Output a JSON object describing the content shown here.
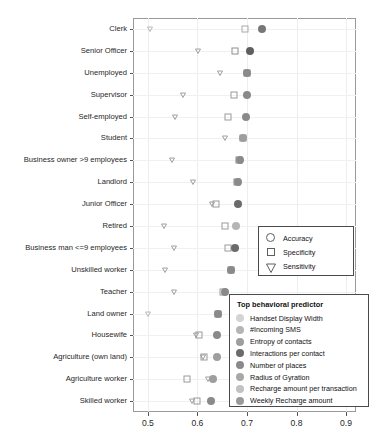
{
  "chart_data": {
    "type": "scatter",
    "title": "",
    "xlabel": "",
    "ylabel": "",
    "xlim": [
      0.47,
      0.92
    ],
    "xticks": [
      "0.5",
      "0.6",
      "0.7",
      "0.8",
      "0.9"
    ],
    "xtick_values": [
      0.5,
      0.6,
      0.7,
      0.8,
      0.9
    ],
    "grid": true,
    "legend_position": "right-inside",
    "categories": [
      "Clerk",
      "Senior Officer",
      "Unemployed",
      "Supervisor",
      "Self-employed",
      "Student",
      "Business owner >9 employees",
      "Landlord",
      "Junior Officer",
      "Retired",
      "Business man <=9 employees",
      "Unskilled worker",
      "Teacher",
      "Land owner",
      "Housewife",
      "Agriculture (own land)",
      "Agriculture worker",
      "Skilled worker"
    ],
    "series": [
      {
        "name": "Accuracy",
        "marker": "circle",
        "values": [
          0.73,
          0.707,
          0.7,
          0.7,
          0.699,
          0.692,
          0.686,
          0.682,
          0.681,
          0.678,
          0.676,
          0.667,
          0.655,
          0.641,
          0.64,
          0.639,
          0.632,
          0.627
        ],
        "colors": [
          "#777777",
          "#5f5f5f",
          "#8a8a8a",
          "#8a8a8a",
          "#8a8a8a",
          "#9e9e9e",
          "#8a8a8a",
          "#8a8a8a",
          "#6b6b6b",
          "#b5b5b5",
          "#6b6b6b",
          "#8a8a8a",
          "#8a8a8a",
          "#8a8a8a",
          "#8a8a8a",
          "#9e9e9e",
          "#9e9e9e",
          "#8a8a8a"
        ]
      },
      {
        "name": "Specificity",
        "marker": "square",
        "values": [
          0.697,
          0.676,
          0.7,
          0.674,
          0.662,
          0.692,
          0.684,
          0.68,
          0.638,
          0.656,
          0.662,
          0.667,
          0.652,
          0.641,
          0.604,
          0.614,
          0.578,
          0.6
        ],
        "colors": [
          "#a8a8a8",
          "#8f8f8f",
          "#8a8a8a",
          "#9a9a9a",
          "#9a9a9a",
          "#9e9e9e",
          "#8a8a8a",
          "#8a8a8a",
          "#9a9a9a",
          "#9a9a9a",
          "#9a9a9a",
          "#8a8a8a",
          "#9a9a9a",
          "#8a8a8a",
          "#9a9a9a",
          "#9a9a9a",
          "#9a9a9a",
          "#9a9a9a"
        ]
      },
      {
        "name": "Sensitivity",
        "marker": "triangle",
        "values": [
          0.505,
          0.601,
          0.645,
          0.57,
          0.555,
          0.655,
          0.548,
          0.592,
          0.63,
          0.532,
          0.553,
          0.535,
          0.552,
          0.5,
          0.597,
          0.611,
          0.622,
          0.59
        ],
        "colors": [
          "#b9b9b9",
          "#a0a0a0",
          "#a0a0a0",
          "#a0a0a0",
          "#a0a0a0",
          "#a0a0a0",
          "#a0a0a0",
          "#a0a0a0",
          "#a0a0a0",
          "#a0a0a0",
          "#a0a0a0",
          "#a0a0a0",
          "#a0a0a0",
          "#b9b9b9",
          "#a0a0a0",
          "#a0a0a0",
          "#a0a0a0",
          "#a0a0a0"
        ]
      }
    ],
    "shape_legend": {
      "title": "",
      "entries": [
        {
          "label": "Accuracy",
          "marker": "circle"
        },
        {
          "label": "Specificity",
          "marker": "square"
        },
        {
          "label": "Sensitivity",
          "marker": "triangle"
        }
      ]
    },
    "color_legend": {
      "title": "Top behavioral predictor",
      "entries": [
        {
          "label": "Handset Display Width",
          "color": "#d4d4d4"
        },
        {
          "label": "#Incoming SMS",
          "color": "#b5b5b5"
        },
        {
          "label": "Entropy of contacts",
          "color": "#9e9e9e"
        },
        {
          "label": "Interactions per contact",
          "color": "#6b6b6b"
        },
        {
          "label": "Number of places",
          "color": "#8a8a8a"
        },
        {
          "label": "Radius of Gyration",
          "color": "#a8a8a8"
        },
        {
          "label": "Recharge amount per transaction",
          "color": "#c2c2c2"
        },
        {
          "label": "Weekly Recharge amount",
          "color": "#9a9a9a"
        }
      ]
    }
  }
}
